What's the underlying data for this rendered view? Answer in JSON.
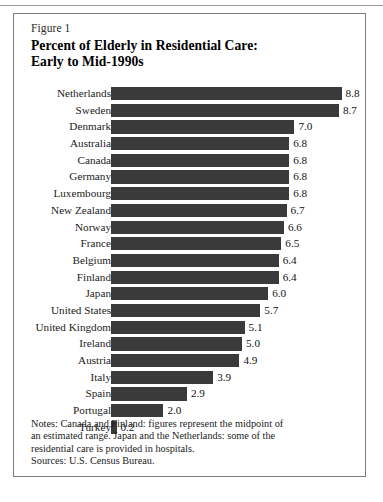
{
  "figure": {
    "label": "Figure 1",
    "title_line1": "Percent of Elderly in Residential Care:",
    "title_line2": "Early to Mid-1990s"
  },
  "notes": {
    "line1": "Notes:  Canada and Finland:  figures represent the midpoint of",
    "line2": "an estimated range. Japan and the Netherlands:  some of the",
    "line3": "residential care is provided in hospitals.",
    "sources": "Sources:  U.S. Census Bureau."
  },
  "colors": {
    "bar": "#3a3a3a",
    "border": "#7d7d7d",
    "background": "#ffffff",
    "text": "#1b1b1b"
  },
  "chart_data": {
    "type": "bar",
    "orientation": "horizontal",
    "title": "Percent of Elderly in Residential Care: Early to Mid-1990s",
    "xlabel": "",
    "ylabel": "",
    "xlim": [
      0,
      8.8
    ],
    "grid": false,
    "legend": false,
    "data_labels": true,
    "categories": [
      "Netherlands",
      "Sweden",
      "Denmark",
      "Australia",
      "Canada",
      "Germany",
      "Luxembourg",
      "New Zealand",
      "Norway",
      "France",
      "Belgium",
      "Finland",
      "Japan",
      "United States",
      "United Kingdom",
      "Ireland",
      "Austria",
      "Italy",
      "Spain",
      "Portugal",
      "Turkey"
    ],
    "values": [
      8.8,
      8.7,
      7.0,
      6.8,
      6.8,
      6.8,
      6.8,
      6.7,
      6.6,
      6.5,
      6.4,
      6.4,
      6.0,
      5.7,
      5.1,
      5.0,
      4.9,
      3.9,
      2.9,
      2.0,
      0.2
    ],
    "value_labels": [
      "8.8",
      "8.7",
      "7.0",
      "6.8",
      "6.8",
      "6.8",
      "6.8",
      "6.7",
      "6.6",
      "6.5",
      "6.4",
      "6.4",
      "6.0",
      "5.7",
      "5.1",
      "5.0",
      "4.9",
      "3.9",
      "2.9",
      "2.0",
      "0.2"
    ]
  }
}
